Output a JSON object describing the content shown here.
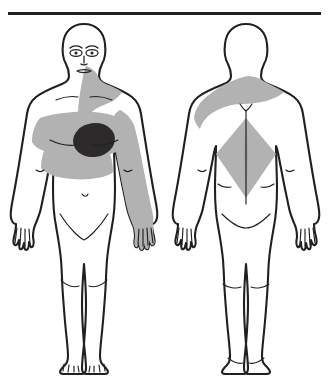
{
  "chart": {
    "type": "body-pain-map",
    "title": "Pain distribution body chart",
    "divider_label": "horizontal rule",
    "background_color": "#ffffff",
    "outline_color": "#231f20",
    "pain_primary_color": "#2d2a2b",
    "pain_secondary_color": "#b2b2b2"
  },
  "views": [
    {
      "id": "anterior",
      "label": "Anterior view",
      "orientation": "front",
      "has_face": true,
      "regions": [
        {
          "name": "left-precordium",
          "label": "Precordial region",
          "intensity": "primary",
          "shape": "oval",
          "color": "#2d2a2b",
          "side": "left"
        },
        {
          "name": "anterior-chest-band",
          "label": "Anterior chest",
          "intensity": "secondary",
          "shape": "band",
          "color": "#b2b2b2",
          "side": "bilateral"
        },
        {
          "name": "sternal-neck-band",
          "label": "Sternum and neck",
          "intensity": "secondary",
          "shape": "vertical-band",
          "color": "#b2b2b2",
          "side": "midline"
        },
        {
          "name": "left-arm-radiation",
          "label": "Left arm to hand",
          "intensity": "secondary",
          "shape": "limb",
          "color": "#b2b2b2",
          "side": "left"
        }
      ]
    },
    {
      "id": "posterior",
      "label": "Posterior view",
      "orientation": "back",
      "has_face": false,
      "regions": [
        {
          "name": "left-shoulder-band",
          "label": "Left shoulder and upper back",
          "intensity": "secondary",
          "shape": "band",
          "color": "#b2b2b2",
          "side": "left"
        },
        {
          "name": "interscapular-diamond",
          "label": "Interscapular region",
          "intensity": "secondary",
          "shape": "diamond",
          "color": "#b2b2b2",
          "side": "midline"
        }
      ]
    }
  ]
}
